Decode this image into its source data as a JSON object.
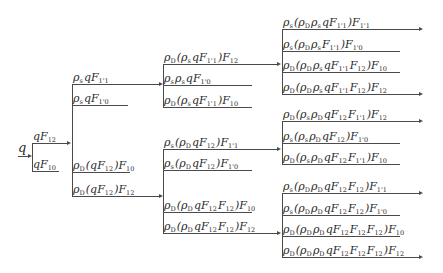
{
  "root": {
    "label": "q"
  },
  "nodes": [
    {
      "id": "n1a",
      "col": 1,
      "label": [
        [
          "q",
          ""
        ],
        [
          "F",
          "12"
        ]
      ],
      "arrow": true
    },
    {
      "id": "n1b",
      "col": 1,
      "label": [
        [
          "q",
          ""
        ],
        [
          "F",
          "10"
        ]
      ],
      "arrow": false
    },
    {
      "id": "n2a",
      "col": 2,
      "label": [
        [
          "ρ",
          "s"
        ],
        [
          "q",
          ""
        ],
        [
          "F",
          "1'1"
        ]
      ],
      "arrow": true
    },
    {
      "id": "n2b",
      "col": 2,
      "label": [
        [
          "ρ",
          "s"
        ],
        [
          "q",
          ""
        ],
        [
          "F",
          "1'0"
        ]
      ],
      "arrow": false
    },
    {
      "id": "n2c",
      "col": 2,
      "label": [
        [
          "ρ",
          "D"
        ],
        [
          "(q",
          ""
        ],
        [
          "F",
          "12"
        ],
        [
          ")",
          ""
        ],
        [
          "F",
          "10"
        ]
      ],
      "arrow": false
    },
    {
      "id": "n2d",
      "col": 2,
      "label": [
        [
          "ρ",
          "D"
        ],
        [
          "(q",
          ""
        ],
        [
          "F",
          "12"
        ],
        [
          ")",
          ""
        ],
        [
          "F",
          "12"
        ]
      ],
      "arrow": true
    },
    {
      "id": "n3a",
      "col": 3,
      "label": [
        [
          "ρ",
          "D"
        ],
        [
          "(",
          ""
        ],
        [
          "ρ",
          "s"
        ],
        [
          "q",
          ""
        ],
        [
          "F",
          "1'1"
        ],
        [
          ")",
          ""
        ],
        [
          "F",
          "12"
        ]
      ],
      "arrow": true
    },
    {
      "id": "n3b",
      "col": 3,
      "label": [
        [
          "ρ",
          "s"
        ],
        [
          "ρ",
          "s"
        ],
        [
          "q",
          ""
        ],
        [
          "F",
          "1'0"
        ]
      ],
      "arrow": false
    },
    {
      "id": "n3c",
      "col": 3,
      "label": [
        [
          "ρ",
          "D"
        ],
        [
          "(",
          ""
        ],
        [
          "ρ",
          "s"
        ],
        [
          "q",
          ""
        ],
        [
          "F",
          "1'1"
        ],
        [
          ")",
          ""
        ],
        [
          "F",
          "10"
        ]
      ],
      "arrow": false
    },
    {
      "id": "n3d",
      "col": 3,
      "label": [
        [
          "ρ",
          "s"
        ],
        [
          "(",
          ""
        ],
        [
          "ρ",
          "D"
        ],
        [
          "q",
          ""
        ],
        [
          "F",
          "12"
        ],
        [
          ")",
          ""
        ],
        [
          "F",
          "1'1"
        ]
      ],
      "arrow": true
    },
    {
      "id": "n3e",
      "col": 3,
      "label": [
        [
          "ρ",
          "s"
        ],
        [
          "(",
          ""
        ],
        [
          "ρ",
          "D"
        ],
        [
          "q",
          ""
        ],
        [
          "F",
          "12"
        ],
        [
          ")",
          ""
        ],
        [
          "F",
          "1'0"
        ]
      ],
      "arrow": false
    },
    {
      "id": "n3f",
      "col": 3,
      "label": [
        [
          "ρ",
          "D"
        ],
        [
          "(",
          ""
        ],
        [
          "ρ",
          "D"
        ],
        [
          "q",
          ""
        ],
        [
          "F",
          "12"
        ],
        [
          "F",
          "12"
        ],
        [
          ")",
          ""
        ],
        [
          "F",
          "10"
        ]
      ],
      "arrow": false
    },
    {
      "id": "n3g",
      "col": 3,
      "label": [
        [
          "ρ",
          "D"
        ],
        [
          "(",
          ""
        ],
        [
          "ρ",
          "D"
        ],
        [
          "q",
          ""
        ],
        [
          "F",
          "12"
        ],
        [
          "F",
          "12"
        ],
        [
          ")",
          ""
        ],
        [
          "F",
          "12"
        ]
      ],
      "arrow": true
    },
    {
      "id": "n4a",
      "col": 4,
      "label": [
        [
          "ρ",
          "s"
        ],
        [
          "(",
          ""
        ],
        [
          "ρ",
          "D"
        ],
        [
          "ρ",
          "s"
        ],
        [
          "q",
          ""
        ],
        [
          "F",
          "1'1"
        ],
        [
          ")",
          ""
        ],
        [
          "F",
          "1'1"
        ]
      ],
      "arrow": true
    },
    {
      "id": "n4b",
      "col": 4,
      "label": [
        [
          "ρ",
          "s"
        ],
        [
          "(",
          ""
        ],
        [
          "ρ",
          "D"
        ],
        [
          "ρ",
          "s"
        ],
        [
          "F",
          "1'1"
        ],
        [
          ")",
          ""
        ],
        [
          "F",
          "1'0"
        ]
      ],
      "arrow": false
    },
    {
      "id": "n4c",
      "col": 4,
      "label": [
        [
          "ρ",
          "D"
        ],
        [
          "(",
          ""
        ],
        [
          "ρ",
          "D"
        ],
        [
          "ρ",
          "s"
        ],
        [
          "q",
          ""
        ],
        [
          "F",
          "1'1"
        ],
        [
          "F",
          "12"
        ],
        [
          ")",
          ""
        ],
        [
          "F",
          "10"
        ]
      ],
      "arrow": false
    },
    {
      "id": "n4d",
      "col": 4,
      "label": [
        [
          "ρ",
          "D"
        ],
        [
          "(",
          ""
        ],
        [
          "ρ",
          "D"
        ],
        [
          "ρ",
          "s"
        ],
        [
          "q",
          ""
        ],
        [
          "F",
          "1'1"
        ],
        [
          "F",
          "12"
        ],
        [
          ")",
          ""
        ],
        [
          "F",
          "12"
        ]
      ],
      "arrow": true
    },
    {
      "id": "n4e",
      "col": 4,
      "label": [
        [
          "ρ",
          "D"
        ],
        [
          "(",
          ""
        ],
        [
          "ρ",
          "s"
        ],
        [
          "ρ",
          "D"
        ],
        [
          "q",
          ""
        ],
        [
          "F",
          "12"
        ],
        [
          "F",
          "1'1"
        ],
        [
          ")",
          ""
        ],
        [
          "F",
          "12"
        ]
      ],
      "arrow": true
    },
    {
      "id": "n4f",
      "col": 4,
      "label": [
        [
          "ρ",
          "s"
        ],
        [
          "(",
          ""
        ],
        [
          "ρ",
          "s"
        ],
        [
          "ρ",
          "D"
        ],
        [
          "q",
          ""
        ],
        [
          "F",
          "12"
        ],
        [
          ")",
          ""
        ],
        [
          "F",
          "1'0"
        ]
      ],
      "arrow": false
    },
    {
      "id": "n4g",
      "col": 4,
      "label": [
        [
          "ρ",
          "D"
        ],
        [
          "(",
          ""
        ],
        [
          "ρ",
          "s"
        ],
        [
          "ρ",
          "D"
        ],
        [
          "q",
          ""
        ],
        [
          "F",
          "12"
        ],
        [
          "F",
          "1'1"
        ],
        [
          ")",
          ""
        ],
        [
          "F",
          "10"
        ]
      ],
      "arrow": false
    },
    {
      "id": "n4h",
      "col": 4,
      "label": [
        [
          "ρ",
          "s"
        ],
        [
          "(",
          ""
        ],
        [
          "ρ",
          "D"
        ],
        [
          "ρ",
          "D"
        ],
        [
          "q",
          ""
        ],
        [
          "F",
          "12"
        ],
        [
          "F",
          "12"
        ],
        [
          ")",
          ""
        ],
        [
          "F",
          "1'1"
        ]
      ],
      "arrow": true
    },
    {
      "id": "n4i",
      "col": 4,
      "label": [
        [
          "ρ",
          "s"
        ],
        [
          "(",
          ""
        ],
        [
          "ρ",
          "D"
        ],
        [
          "ρ",
          "D"
        ],
        [
          "q",
          ""
        ],
        [
          "F",
          "12"
        ],
        [
          "F",
          "12"
        ],
        [
          ")",
          ""
        ],
        [
          "F",
          "1'0"
        ]
      ],
      "arrow": false
    },
    {
      "id": "n4j",
      "col": 4,
      "label": [
        [
          "ρ",
          "D"
        ],
        [
          "(",
          ""
        ],
        [
          "ρ",
          "D"
        ],
        [
          "ρ",
          "D"
        ],
        [
          "q",
          ""
        ],
        [
          "F",
          "12"
        ],
        [
          "F",
          "12"
        ],
        [
          "F",
          "12"
        ],
        [
          ")",
          ""
        ],
        [
          "F",
          "10"
        ]
      ],
      "arrow": false
    },
    {
      "id": "n4k",
      "col": 4,
      "label": [
        [
          "ρ",
          "D"
        ],
        [
          "(",
          ""
        ],
        [
          "ρ",
          "D"
        ],
        [
          "ρ",
          "D"
        ],
        [
          "q",
          ""
        ],
        [
          "F",
          "12"
        ],
        [
          "F",
          "12"
        ],
        [
          "F",
          "12"
        ],
        [
          ")",
          ""
        ],
        [
          "F",
          "12"
        ]
      ],
      "arrow": true
    }
  ],
  "edges": [
    {
      "from": "root",
      "to": [
        "n1a",
        "n1b"
      ]
    },
    {
      "from": "n1a",
      "to": [
        "n2a",
        "n2b",
        "n2c",
        "n2d"
      ]
    },
    {
      "from": "n2a",
      "to": [
        "n3a",
        "n3b",
        "n3c"
      ]
    },
    {
      "from": "n2d",
      "to": [
        "n3d",
        "n3e",
        "n3f",
        "n3g"
      ]
    },
    {
      "from": "n3a",
      "to": [
        "n4a",
        "n4b",
        "n4c",
        "n4d"
      ]
    },
    {
      "from": "n3d",
      "to": [
        "n4e",
        "n4f",
        "n4g"
      ]
    },
    {
      "from": "n3g",
      "to": [
        "n4h",
        "n4i",
        "n4j",
        "n4k"
      ]
    }
  ]
}
